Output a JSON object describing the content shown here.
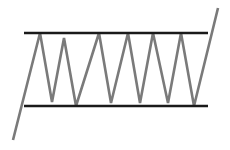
{
  "diagram": {
    "type": "rectangle-channel-pattern",
    "background": "#ffffff",
    "resistance_line": {
      "color": "#1a1a1a",
      "width": 2.6,
      "x1": 24,
      "y1": 33,
      "x2": 208,
      "y2": 33
    },
    "support_line": {
      "color": "#1a1a1a",
      "width": 2.6,
      "x1": 24,
      "y1": 106,
      "x2": 208,
      "y2": 106
    },
    "price_path": {
      "color": "#7a7a7a",
      "width": 2.6,
      "points": [
        [
          13,
          140
        ],
        [
          40,
          33
        ],
        [
          52,
          102
        ],
        [
          64,
          38
        ],
        [
          76,
          106
        ],
        [
          99,
          33
        ],
        [
          111,
          103
        ],
        [
          128,
          33
        ],
        [
          140,
          103
        ],
        [
          153,
          33
        ],
        [
          168,
          103
        ],
        [
          181,
          33
        ],
        [
          194,
          106
        ],
        [
          218,
          8
        ]
      ]
    }
  }
}
